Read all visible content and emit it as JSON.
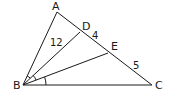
{
  "diagram": {
    "type": "geometry-triangle",
    "points": {
      "A": {
        "label": "A",
        "x": 57,
        "y": 12
      },
      "B": {
        "label": "B",
        "x": 23,
        "y": 85
      },
      "C": {
        "label": "C",
        "x": 152,
        "y": 85
      },
      "D": {
        "label": "D",
        "x": 80,
        "y": 32
      },
      "E": {
        "label": "E",
        "x": 108,
        "y": 53
      }
    },
    "segments": [
      "AB",
      "BC",
      "AC",
      "BD",
      "BE"
    ],
    "measures": {
      "BD": "12",
      "DE": "4",
      "EC": "5"
    },
    "angle_marks": [
      "angle ABD (single arc)",
      "angle DBE (single arc)",
      "angle EBC (single arc)"
    ]
  }
}
